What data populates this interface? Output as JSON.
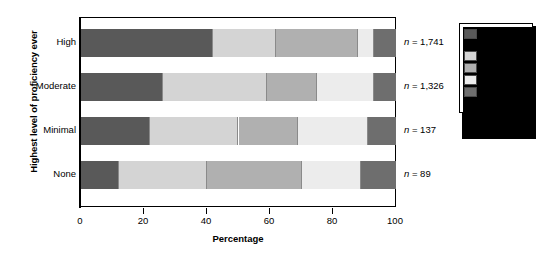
{
  "chart_data": {
    "type": "bar",
    "subtype": "horizontal-stacked-100",
    "title": "",
    "xlabel": "Percentage",
    "ylabel": "Highest level of proficiency ever",
    "xlim": [
      0,
      100
    ],
    "xticks": [
      0,
      20,
      40,
      60,
      80,
      100
    ],
    "xticklabels": [
      "0",
      "20",
      "40",
      "60",
      "80",
      "100"
    ],
    "grid": false,
    "legend_position": "right",
    "categories": [
      "High",
      "Moderate",
      "Minimal",
      "None"
    ],
    "group_sizes": [
      "n = 1,741",
      "n = 1,326",
      "n = 137",
      "n = 89"
    ],
    "series": [
      {
        "name": "Strongly agree",
        "color": "#595959",
        "values": [
          42,
          26,
          22,
          12
        ]
      },
      {
        "name": "Agree",
        "color": "#d4d4d4",
        "values": [
          20,
          33,
          28,
          28
        ]
      },
      {
        "name": "Neutral",
        "color": "#b0b0b0",
        "values": [
          26,
          16,
          19,
          30
        ]
      },
      {
        "name": "Disagree",
        "color": "#ececec",
        "values": [
          5,
          18,
          22,
          19
        ]
      },
      {
        "name": "Strongly disagree",
        "color": "#6e6e6e",
        "values": [
          7,
          7,
          9,
          11
        ]
      }
    ]
  },
  "axis": {
    "y_title": "Highest level of proficiency ever",
    "x_title": "Percentage"
  },
  "legend": {
    "entries": [
      {
        "label": "Strongly agree",
        "color": "#595959"
      },
      {
        "label": "Agree",
        "color": "#d4d4d4"
      },
      {
        "label": "Neutral",
        "color": "#b0b0b0"
      },
      {
        "label": "Disagree",
        "color": "#ececec"
      },
      {
        "label": "Strongly disagree",
        "color": "#6e6e6e"
      }
    ]
  }
}
